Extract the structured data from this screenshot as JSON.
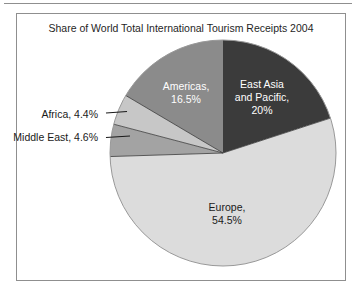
{
  "chart_data": {
    "type": "pie",
    "title": "Share of World Total International Tourism Receipts 2004",
    "start_angle_deg": 0,
    "direction": "clockwise",
    "legend": "none",
    "labels_on_chart": true,
    "slices": [
      {
        "name": "East Asia and Pacific",
        "value": 20,
        "color": "#3b3b3b",
        "label_color": "#ffffff"
      },
      {
        "name": "Europe",
        "value": 54.5,
        "color": "#dcdcdc",
        "label_color": "#1a1a1a"
      },
      {
        "name": "Middle East",
        "value": 4.6,
        "color": "#a3a3a3",
        "label_color": "#1a1a1a"
      },
      {
        "name": "Africa",
        "value": 4.4,
        "color": "#c7c7c7",
        "label_color": "#1a1a1a"
      },
      {
        "name": "Americas",
        "value": 16.5,
        "color": "#8b8b8b",
        "label_color": "#ffffff"
      }
    ],
    "outline_color": "#999999",
    "divider_color": "#3a3a3a"
  },
  "labels": {
    "east_asia": {
      "lines": [
        "East Asia",
        "and Pacific,",
        "20%"
      ]
    },
    "americas": {
      "lines": [
        "Americas,",
        "16.5%"
      ]
    },
    "europe": {
      "lines": [
        "Europe,",
        "54.5%"
      ]
    },
    "africa": {
      "text": "Africa, 4.4%"
    },
    "middle_east": {
      "text": "Middle East, 4.6%"
    }
  }
}
